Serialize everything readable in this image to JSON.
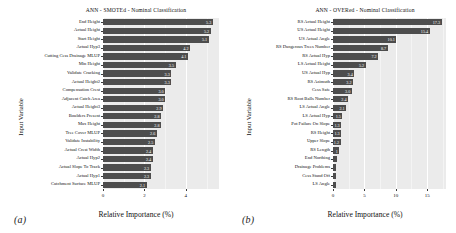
{
  "figure": {
    "panels": [
      {
        "tag": "(a)",
        "title": "ANN - SMOTEd - Nominal Classification",
        "xlabel": "Relative Importance (%)",
        "ylabel": "Input Variable"
      },
      {
        "tag": "(b)",
        "title": "ANN - OVERed - Nominal Classification",
        "xlabel": "Relative Importance (%)",
        "ylabel": "Input Variable"
      }
    ]
  },
  "chart_data": [
    {
      "type": "bar",
      "orientation": "horizontal",
      "title": "ANN - SMOTEd - Nominal Classification",
      "xlabel": "Relative Importance (%)",
      "ylabel": "Input Variable",
      "xlim": [
        0,
        5.6
      ],
      "xticks": [
        0,
        2,
        4
      ],
      "grid": true,
      "legend": "none",
      "bar_color": "#4d4d4d",
      "panel_background": "#ebebeb",
      "categories": [
        "End Height",
        "Actual Height",
        "Start Height",
        "Actual Hyp3",
        "Cutting Cess Drainage MLUP",
        "Min Height",
        "Validate Cracking",
        "Actual Height2",
        "Compensation Crest",
        "Adjacent Catch Area",
        "Actual Height3",
        "Boulders Present",
        "Max Height",
        "Tree Cover MLUP",
        "Validate Instability",
        "Actual Crest Width",
        "Actual Hyp2",
        "Actual Slope To Track",
        "Actual Hyp1",
        "Catchment Surface MLUP"
      ],
      "values": [
        5.3,
        5.2,
        5.1,
        4.2,
        4.1,
        3.5,
        3.3,
        3.3,
        3.0,
        3.0,
        2.9,
        2.8,
        2.8,
        2.6,
        2.5,
        2.4,
        2.4,
        2.3,
        2.3,
        2.1
      ],
      "value_labels": [
        "5.3",
        "5.2",
        "5.1",
        "4.2",
        "4.1",
        "3.5",
        "3.3",
        "3.3",
        "3.0",
        "3.0",
        "2.9",
        "2.8",
        "2.8",
        "2.6",
        "2.5",
        "2.4",
        "2.4",
        "2.3",
        "2.3",
        "2.1"
      ]
    },
    {
      "type": "bar",
      "orientation": "horizontal",
      "title": "ANN - OVERed - Nominal Classification",
      "xlabel": "Relative Importance (%)",
      "ylabel": "Input Variable",
      "xlim": [
        0,
        18.0
      ],
      "xticks": [
        0,
        5,
        10,
        15
      ],
      "grid": true,
      "legend": "none",
      "bar_color": "#4d4d4d",
      "panel_background": "#ebebeb",
      "categories": [
        "RS Actual Height",
        "US Actual Height",
        "US Actual Angle",
        "RS Dangerous Trees Number",
        "RS Actual Hyp",
        "LS Actual Height",
        "US Actual Hyp",
        "RS Azimuth",
        "Cess Safe",
        "RS Root Balls Number",
        "LS Actual Angle",
        "LS Actual Hyp",
        "Pot Failure On Slope",
        "RS Height",
        "Upper Slope",
        "RS Length",
        "End Northing",
        "Drainage Problems",
        "Cess Stand Off",
        "LS Angle"
      ],
      "values": [
        17.3,
        15.4,
        10.1,
        8.7,
        7.2,
        5.2,
        3.4,
        3.2,
        3.0,
        2.4,
        2.1,
        1.5,
        1.3,
        1.3,
        1.2,
        1.0,
        0.6,
        0.5,
        0.4,
        0.4
      ],
      "value_labels": [
        "17.3",
        "15.4",
        "10.1",
        "8.7",
        "7.2",
        "5.2",
        "3.4",
        "3.2",
        "3.0",
        "2.4",
        "2.1",
        "1.5",
        "1.3",
        "1.3",
        "1.2",
        "1",
        "",
        "",
        "",
        ""
      ]
    }
  ]
}
